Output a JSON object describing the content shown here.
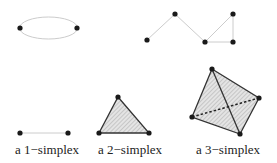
{
  "figure": {
    "labels": {
      "one_simplex": "a 1−simplex",
      "two_simplex": "a 2−simplex",
      "three_simplex": "a 3−simplex"
    },
    "colors": {
      "vertex": "#1a1a1a",
      "light_edge": "#cfcfcf",
      "dark_edge": "#333333",
      "fill": "#d6d6d6"
    }
  }
}
